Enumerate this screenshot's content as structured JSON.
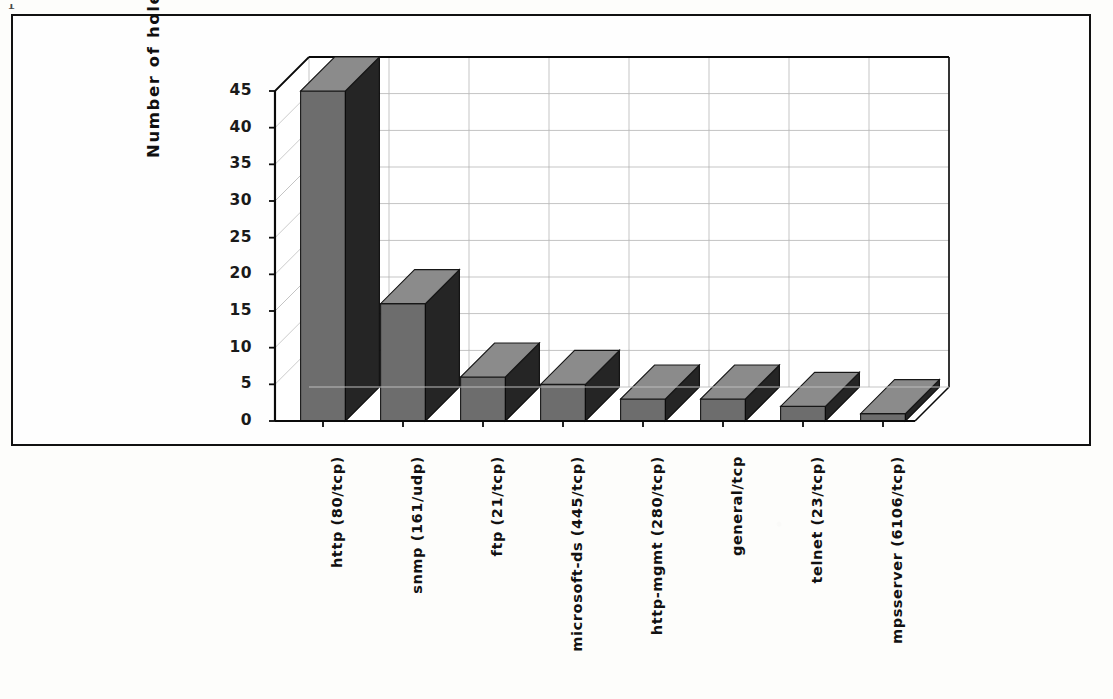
{
  "figure": {
    "cut_off_glyph": "F",
    "y_axis_title": "Number of holes"
  },
  "chart_data": {
    "type": "bar",
    "title": "",
    "subtitle": "",
    "xlabel": "",
    "ylabel": "Number of holes",
    "categories": [
      "http (80/tcp)",
      "snmp (161/udp)",
      "ftp (21/tcp)",
      "microsoft-ds (445/tcp)",
      "http-mgmt (280/tcp)",
      "general/tcp",
      "telnet (23/tcp)",
      "mpsserver (6106/tcp)"
    ],
    "values": [
      45,
      16,
      6,
      5,
      3,
      3,
      2,
      1
    ],
    "ylim": [
      0,
      45
    ],
    "ytick_labels": [
      "0",
      "5",
      "10",
      "15",
      "20",
      "25",
      "30",
      "35",
      "40",
      "45"
    ],
    "ytick_values": [
      0,
      5,
      10,
      15,
      20,
      25,
      30,
      35,
      40,
      45
    ],
    "grid": true,
    "legend": "none",
    "style": "3d-bar",
    "bar_face_color": "#6e6e6e",
    "bar_side_color": "#2a2a2a",
    "bar_top_color": "#8a8a8a",
    "axis_color": "#111111",
    "grid_color": "#b9b9b9",
    "background_color": "#fefefe"
  }
}
